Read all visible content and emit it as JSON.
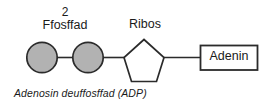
{
  "diagram": {
    "phosphate_group": {
      "count_label": "2",
      "name_label": "Ffosffad",
      "circle_fill": "#b2b2b2",
      "circle_stroke": "#2b2b2b"
    },
    "ribose": {
      "label": "Ribos",
      "shape_fill": "#ffffff",
      "shape_stroke": "#2b2b2b"
    },
    "adenine": {
      "label": "Adenin",
      "box_fill": "#ffffff",
      "box_stroke": "#2b2b2b"
    },
    "caption": "Adenosin deuffosffad (ADP)",
    "bond_color": "#2b2b2b",
    "background": "#ffffff"
  }
}
